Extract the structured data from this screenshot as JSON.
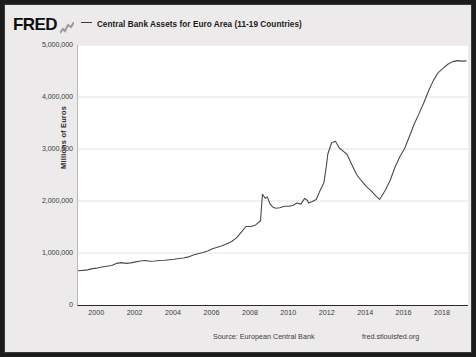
{
  "header": {
    "logo_text": "FRED",
    "logo_glyph_name": "fred-chart-glyph",
    "series_label": "Central Bank Assets for Euro Area (11-19 Countries)"
  },
  "footer": {
    "source": "Source: European Central Bank",
    "url": "fred.stlouisfed.org"
  },
  "colors": {
    "line": "#4a4a4a",
    "grid": "#e2e2e2",
    "plot_background": "#ffffff",
    "page_background": "#eceaea",
    "frame_border": "#1c1c1c",
    "text": "#3c3c3c"
  },
  "chart_data": {
    "type": "line",
    "title": "Central Bank Assets for Euro Area (11-19 Countries)",
    "xlabel": "",
    "ylabel": "Millions of Euros",
    "ylim": [
      0,
      5000000
    ],
    "xlim": [
      1999.0,
      2019.3
    ],
    "grid": true,
    "legend_position": "top",
    "ytick_labels": [
      "0",
      "1,000,000",
      "2,000,000",
      "3,000,000",
      "4,000,000",
      "5,000,000"
    ],
    "ytick_values": [
      0,
      1000000,
      2000000,
      3000000,
      4000000,
      5000000
    ],
    "xtick_labels": [
      "2000",
      "2002",
      "2004",
      "2006",
      "2008",
      "2010",
      "2012",
      "2014",
      "2016",
      "2018"
    ],
    "xtick_values": [
      2000,
      2002,
      2004,
      2006,
      2008,
      2010,
      2012,
      2014,
      2016,
      2018
    ],
    "series": [
      {
        "name": "Central Bank Assets for Euro Area (11-19 Countries)",
        "color": "#4a4a4a",
        "x": [
          1999.0,
          1999.25,
          1999.5,
          1999.75,
          2000.0,
          2000.25,
          2000.5,
          2000.75,
          2001.0,
          2001.25,
          2001.5,
          2001.75,
          2002.0,
          2002.25,
          2002.5,
          2002.75,
          2003.0,
          2003.25,
          2003.5,
          2003.75,
          2004.0,
          2004.25,
          2004.5,
          2004.75,
          2005.0,
          2005.25,
          2005.5,
          2005.75,
          2006.0,
          2006.25,
          2006.5,
          2006.75,
          2007.0,
          2007.25,
          2007.5,
          2007.75,
          2008.0,
          2008.25,
          2008.5,
          2008.6,
          2008.75,
          2008.85,
          2009.0,
          2009.15,
          2009.3,
          2009.5,
          2009.75,
          2010.0,
          2010.2,
          2010.4,
          2010.6,
          2010.8,
          2010.95,
          2011.0,
          2011.2,
          2011.4,
          2011.6,
          2011.8,
          2011.95,
          2012.0,
          2012.2,
          2012.4,
          2012.6,
          2012.8,
          2013.0,
          2013.25,
          2013.5,
          2013.75,
          2014.0,
          2014.25,
          2014.5,
          2014.7,
          2014.9,
          2015.0,
          2015.25,
          2015.5,
          2015.75,
          2016.0,
          2016.25,
          2016.5,
          2016.75,
          2017.0,
          2017.25,
          2017.5,
          2017.75,
          2018.0,
          2018.25,
          2018.5,
          2018.75,
          2019.0,
          2019.2
        ],
        "y": [
          660000,
          665000,
          675000,
          700000,
          710000,
          730000,
          745000,
          760000,
          800000,
          815000,
          800000,
          810000,
          830000,
          845000,
          855000,
          840000,
          845000,
          855000,
          860000,
          870000,
          880000,
          895000,
          905000,
          925000,
          960000,
          985000,
          1010000,
          1040000,
          1080000,
          1110000,
          1140000,
          1180000,
          1220000,
          1290000,
          1400000,
          1510000,
          1510000,
          1540000,
          1620000,
          2130000,
          2050000,
          2080000,
          1940000,
          1880000,
          1860000,
          1870000,
          1900000,
          1900000,
          1920000,
          1960000,
          1940000,
          2050000,
          2010000,
          1960000,
          1990000,
          2030000,
          2200000,
          2350000,
          2730000,
          2900000,
          3120000,
          3150000,
          3020000,
          2960000,
          2900000,
          2700000,
          2510000,
          2390000,
          2280000,
          2200000,
          2100000,
          2030000,
          2150000,
          2210000,
          2400000,
          2650000,
          2850000,
          3010000,
          3240000,
          3480000,
          3680000,
          3890000,
          4120000,
          4320000,
          4470000,
          4550000,
          4630000,
          4680000,
          4700000,
          4690000,
          4695000
        ]
      }
    ]
  }
}
